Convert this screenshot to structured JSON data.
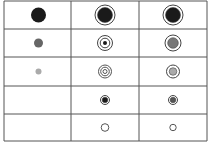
{
  "grid": {
    "rows": 5,
    "columns": 3,
    "line_color": "#555555",
    "cells": [
      [
        {
          "symbol": "solid-dot",
          "size": "large",
          "fill": "#1a1a1a"
        },
        {
          "symbol": "dot-in-ring",
          "size": "large",
          "fill": "#1a1a1a"
        },
        {
          "symbol": "dot-in-ring",
          "size": "large",
          "fill": "#1a1a1a"
        }
      ],
      [
        {
          "symbol": "solid-dot",
          "size": "medium",
          "fill": "#666666"
        },
        {
          "symbol": "dot-in-double-ring",
          "size": "medium",
          "fill": "#1a1a1a"
        },
        {
          "symbol": "dot-in-ring",
          "size": "medium",
          "fill": "#777777"
        }
      ],
      [
        {
          "symbol": "solid-dot",
          "size": "small",
          "fill": "#aaaaaa"
        },
        {
          "symbol": "triple-ring",
          "size": "small",
          "fill": "#ffffff"
        },
        {
          "symbol": "dot-in-ring",
          "size": "small",
          "fill": "#aaaaaa"
        }
      ],
      [
        {
          "symbol": "empty",
          "size": "none",
          "fill": "#ffffff"
        },
        {
          "symbol": "dot-in-ring",
          "size": "tiny",
          "fill": "#1a1a1a"
        },
        {
          "symbol": "dot-in-ring",
          "size": "tiny",
          "fill": "#555555"
        }
      ],
      [
        {
          "symbol": "empty",
          "size": "none",
          "fill": "#ffffff"
        },
        {
          "symbol": "hollow-circle",
          "size": "tiny",
          "fill": "#ffffff"
        },
        {
          "symbol": "hollow-circle",
          "size": "tiny",
          "fill": "#ffffff"
        }
      ]
    ]
  }
}
